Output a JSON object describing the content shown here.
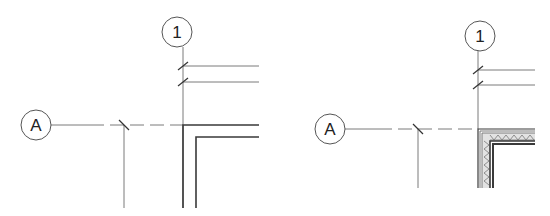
{
  "panels": [
    {
      "name": "left-detail",
      "grid_bubbles": [
        {
          "label": "1",
          "cx": 177,
          "cy": 32,
          "r": 15
        },
        {
          "label": "A",
          "cx": 36,
          "cy": 125,
          "r": 15
        }
      ],
      "wall_type": "simple",
      "description": "Grid intersection with simple two-line wall corner"
    },
    {
      "name": "right-detail",
      "grid_bubbles": [
        {
          "label": "1",
          "cx": 480,
          "cy": 36,
          "r": 15
        },
        {
          "label": "A",
          "cx": 330,
          "cy": 129,
          "r": 15
        }
      ],
      "wall_type": "layered-insulated",
      "description": "Grid intersection with layered wall corner showing insulation hatch"
    }
  ],
  "colors": {
    "grid_line": "#7a7a7a",
    "wall_line": "#3a3a3a",
    "hatch": "#777777",
    "background": "#ffffff"
  }
}
